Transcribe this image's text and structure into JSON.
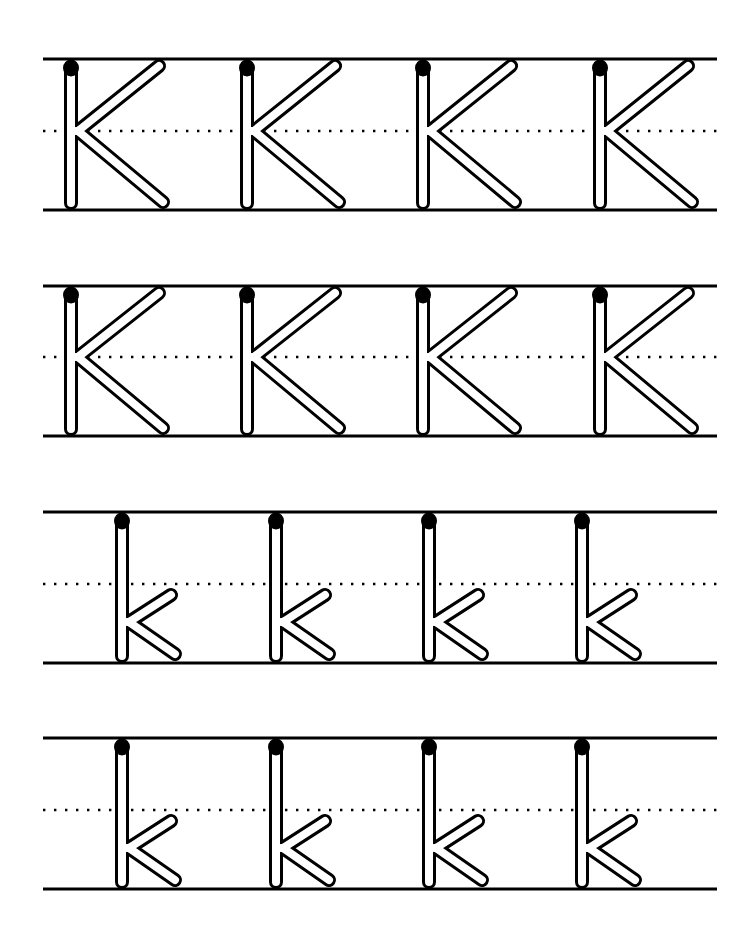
{
  "worksheet": {
    "title": "Letter K tracing practice",
    "ink_color": "#000000",
    "paper_color": "#ffffff",
    "line_left": 43,
    "line_right": 717,
    "rows": [
      {
        "case": "uppercase",
        "letter": "K",
        "top_line_y": 59,
        "mid_line_y": 131,
        "base_line_y": 210,
        "stems_x": [
          71,
          247,
          423,
          600
        ]
      },
      {
        "case": "uppercase",
        "letter": "K",
        "top_line_y": 286,
        "mid_line_y": 357,
        "base_line_y": 436,
        "stems_x": [
          71,
          247,
          423,
          600
        ]
      },
      {
        "case": "lowercase",
        "letter": "k",
        "top_line_y": 512,
        "mid_line_y": 584,
        "base_line_y": 663,
        "stems_x": [
          122,
          276,
          429,
          582
        ]
      },
      {
        "case": "lowercase",
        "letter": "k",
        "top_line_y": 738,
        "mid_line_y": 810,
        "base_line_y": 889,
        "stems_x": [
          122,
          276,
          429,
          582
        ]
      }
    ]
  }
}
